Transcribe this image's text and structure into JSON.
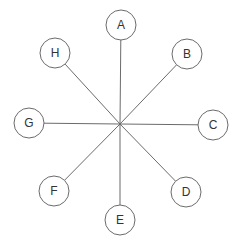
{
  "diagram": {
    "type": "star",
    "hub": {
      "x": 120,
      "y": 124
    },
    "colors": {
      "stroke": "#6b6b6b",
      "text": "#333333",
      "fill": "#ffffff"
    },
    "radius": 15,
    "nodes": [
      {
        "label": "A",
        "x": 121,
        "y": 25
      },
      {
        "label": "B",
        "x": 187,
        "y": 54
      },
      {
        "label": "C",
        "x": 213,
        "y": 125
      },
      {
        "label": "D",
        "x": 186,
        "y": 192
      },
      {
        "label": "E",
        "x": 120,
        "y": 220
      },
      {
        "label": "F",
        "x": 54,
        "y": 191
      },
      {
        "label": "G",
        "x": 29,
        "y": 123
      },
      {
        "label": "H",
        "x": 55,
        "y": 53
      }
    ]
  }
}
